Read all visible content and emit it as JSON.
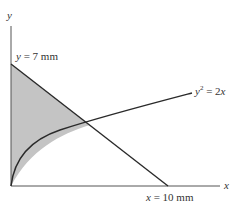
{
  "figure": {
    "axes": {
      "x_label": "x",
      "y_label": "y"
    },
    "labels": {
      "y_intercept": {
        "var": "y",
        "eq": " = 7 mm"
      },
      "x_intercept": {
        "var": "x",
        "eq": " = 10 mm"
      },
      "curve": {
        "var": "y",
        "exp": "2",
        "eq": " = 2",
        "var2": "x"
      }
    },
    "colors": {
      "line": "#2a2a2a",
      "fill": "#c4c4c4",
      "axis": "#555555"
    }
  }
}
